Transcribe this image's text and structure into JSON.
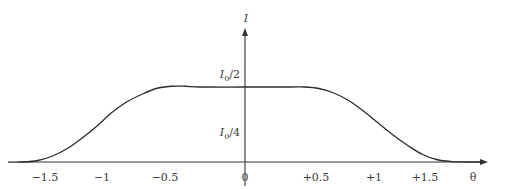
{
  "chart_data": {
    "type": "line",
    "title": "",
    "xlabel": "θ",
    "ylabel": "I",
    "xlim": [
      -1.7,
      1.7
    ],
    "ylim": [
      0,
      0.55
    ],
    "grid": false,
    "legend": "none",
    "x_ticks": [
      "-1.5",
      "-1",
      "-0.5",
      "0",
      "+0.5",
      "+1",
      "+1.5"
    ],
    "x_tick_labels": [
      "−1.5",
      "−1",
      "−0.5",
      "0",
      "+0.5",
      "+1",
      "+1.5"
    ],
    "y_tick_labels": [
      {
        "base": "I",
        "sub": "0",
        "rest": "/2",
        "value": 0.5
      },
      {
        "base": "I",
        "sub": "0",
        "rest": "/4",
        "value": 0.25
      }
    ],
    "series": [
      {
        "name": "I(θ)",
        "x": [
          -1.6,
          -1.5,
          -1.4,
          -1.3,
          -1.2,
          -1.1,
          -1.0,
          -0.9,
          -0.8,
          -0.7,
          -0.6,
          -0.5,
          -0.4,
          -0.3,
          0,
          0.3,
          0.4,
          0.5,
          0.6,
          0.7,
          0.8,
          0.9,
          1.0,
          1.1,
          1.2,
          1.3,
          1.4,
          1.5,
          1.6
        ],
        "y": [
          0,
          0.0,
          0.01,
          0.04,
          0.09,
          0.16,
          0.24,
          0.33,
          0.4,
          0.45,
          0.49,
          0.505,
          0.505,
          0.5,
          0.5,
          0.5,
          0.5,
          0.49,
          0.46,
          0.41,
          0.34,
          0.26,
          0.18,
          0.11,
          0.05,
          0.015,
          0.003,
          0,
          0
        ]
      }
    ]
  }
}
